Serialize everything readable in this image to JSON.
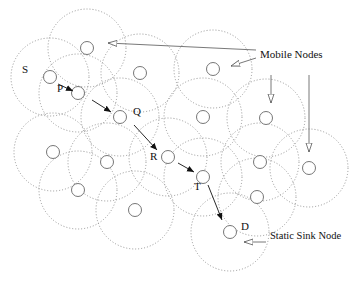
{
  "diagram": {
    "colors": {
      "range": "#8a8a8a",
      "node": "#666666",
      "arrow": "#111111",
      "callout": "#555555"
    },
    "range_radius": 39,
    "node_radius": 6.5,
    "nodes": [
      {
        "id": "n1",
        "x": 87,
        "y": 48
      },
      {
        "id": "S",
        "x": 50,
        "y": 77,
        "label": "S",
        "lx": 22,
        "ly": 70
      },
      {
        "id": "P",
        "x": 78,
        "y": 93,
        "label": "P",
        "lx": 57,
        "ly": 89
      },
      {
        "id": "n4",
        "x": 140,
        "y": 73
      },
      {
        "id": "n5",
        "x": 213,
        "y": 69
      },
      {
        "id": "Q",
        "x": 120,
        "y": 117,
        "label": "Q",
        "lx": 133,
        "ly": 112
      },
      {
        "id": "n7",
        "x": 203,
        "y": 117
      },
      {
        "id": "n8",
        "x": 266,
        "y": 118
      },
      {
        "id": "n9",
        "x": 53,
        "y": 152
      },
      {
        "id": "n10",
        "x": 107,
        "y": 162
      },
      {
        "id": "R",
        "x": 168,
        "y": 157,
        "label": "R",
        "lx": 150,
        "ly": 157
      },
      {
        "id": "n12",
        "x": 260,
        "y": 162
      },
      {
        "id": "n13",
        "x": 309,
        "y": 168
      },
      {
        "id": "T",
        "x": 203,
        "y": 177,
        "label": "T",
        "lx": 194,
        "ly": 187
      },
      {
        "id": "n15",
        "x": 78,
        "y": 190
      },
      {
        "id": "n16",
        "x": 257,
        "y": 197
      },
      {
        "id": "n17",
        "x": 135,
        "y": 210
      },
      {
        "id": "D",
        "x": 230,
        "y": 232,
        "label": "D",
        "lx": 241,
        "ly": 227
      }
    ],
    "route_arrows": [
      {
        "from": [
          58,
          84
        ],
        "to": [
          73,
          91
        ]
      },
      {
        "from": [
          92,
          100
        ],
        "to": [
          111,
          112
        ]
      },
      {
        "from": [
          134,
          125
        ],
        "to": [
          157,
          150
        ]
      },
      {
        "from": [
          178,
          163
        ],
        "to": [
          194,
          172
        ]
      },
      {
        "from": [
          208,
          185
        ],
        "to": [
          222,
          220
        ]
      }
    ],
    "callouts": [
      {
        "name": "mobile-nodes",
        "text": "Mobile Nodes",
        "x": 260,
        "y": 55
      },
      {
        "name": "static-sink-node",
        "text": "Static Sink Node",
        "x": 270,
        "y": 237
      }
    ],
    "callout_arrows": [
      {
        "from": [
          256,
          50
        ],
        "to": [
          108,
          43
        ]
      },
      {
        "from": [
          256,
          58
        ],
        "to": [
          231,
          66
        ]
      },
      {
        "from": [
          271,
          75
        ],
        "to": [
          271,
          103
        ]
      },
      {
        "from": [
          309,
          75
        ],
        "to": [
          309,
          152
        ]
      },
      {
        "from": [
          266,
          242
        ],
        "to": [
          244,
          242
        ]
      }
    ]
  }
}
